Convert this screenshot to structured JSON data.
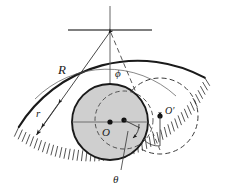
{
  "figure": {
    "background_color": "#ffffff",
    "stroke_color": "#1a1a1a",
    "cylinder_fill_color": "#cfcfcf",
    "dashed_color": "#4a4a4a",
    "width": 228,
    "height": 190
  },
  "labels": {
    "radius_large": "R",
    "radius_small": "r",
    "angle_phi": "ϕ",
    "angle_theta": "θ",
    "center_main": "O",
    "center_displaced": "O′"
  },
  "geometry": {
    "pivot": {
      "x": 110,
      "y": 30,
      "name": "pivot-point"
    },
    "surface_center": {
      "x": 110,
      "y": 30
    },
    "surface_radius": 140,
    "cylinder_center": {
      "x": 110,
      "y": 122
    },
    "cylinder_radius": 38,
    "displaced_center": {
      "x": 124,
      "y": 120
    },
    "displaced_circle_center": {
      "x": 160,
      "y": 116
    },
    "displaced_circle_radius": 38,
    "phi_degrees": 14,
    "theta_degrees": 14
  },
  "annotations": {
    "hatching_count": 58,
    "dimension_arrows": [
      "R-arrow-up",
      "R-arrow-down",
      "r-arrow-up",
      "r-arrow-down"
    ],
    "arc_arrows": [
      "phi-arc-arrow",
      "theta-arc-arrow"
    ]
  }
}
